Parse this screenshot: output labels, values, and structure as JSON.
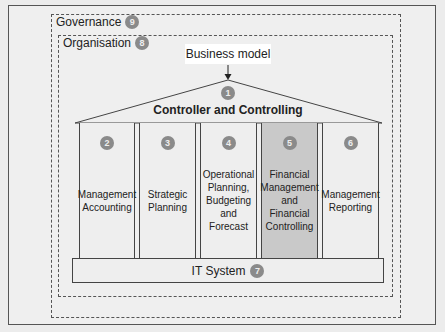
{
  "diagram": {
    "type": "temple",
    "governance": {
      "label": "Governance",
      "badge": "9"
    },
    "organisation": {
      "label": "Organisation",
      "badge": "8"
    },
    "business_model": {
      "label": "Business model"
    },
    "roof": {
      "label": "Controller and Controlling",
      "badge": "1"
    },
    "pillars": [
      {
        "badge": "2",
        "label": "Management\nAccounting",
        "highlighted": false
      },
      {
        "badge": "3",
        "label": "Strategic\nPlanning",
        "highlighted": false
      },
      {
        "badge": "4",
        "label": "Operational\nPlanning,\nBudgeting\nand Forecast",
        "highlighted": false
      },
      {
        "badge": "5",
        "label": "Financial\nManagement\nand Financial\nControlling",
        "highlighted": true
      },
      {
        "badge": "6",
        "label": "Management\nReporting",
        "highlighted": false
      }
    ],
    "foundation": {
      "label": "IT System",
      "badge": "7"
    },
    "colors": {
      "badge": "#8a8a8a",
      "highlight": "#c9c9c9",
      "line": "#444444",
      "background": "#efefef"
    }
  }
}
